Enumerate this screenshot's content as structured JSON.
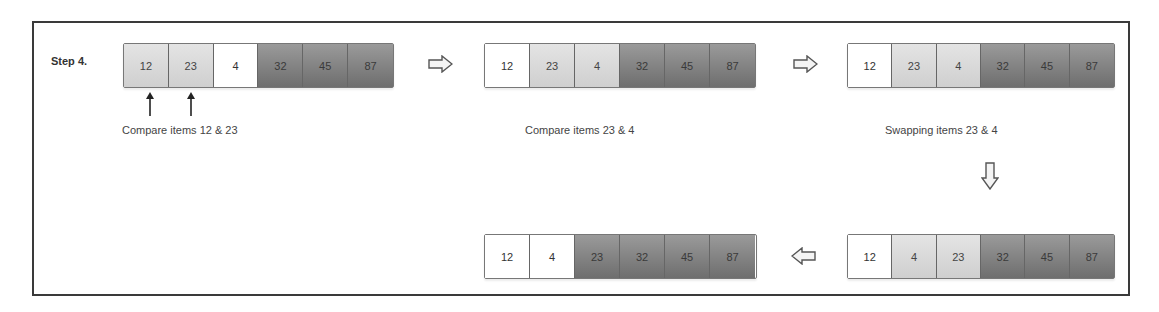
{
  "step_label": "Step 4.",
  "colors": {
    "white_cell": "#ffffff",
    "light_cell": "#d9d9d9",
    "dark_cell": "#858585",
    "frame_border": "#3a3a3a",
    "text": "#333333"
  },
  "stages": [
    {
      "id": "stage1",
      "cells": [
        {
          "value": "12",
          "shade": "light"
        },
        {
          "value": "23",
          "shade": "light"
        },
        {
          "value": "4",
          "shade": "white"
        },
        {
          "value": "32",
          "shade": "dark"
        },
        {
          "value": "45",
          "shade": "dark"
        },
        {
          "value": "87",
          "shade": "dark"
        }
      ],
      "caption": "Compare items 12 & 23"
    },
    {
      "id": "stage2",
      "cells": [
        {
          "value": "12",
          "shade": "white"
        },
        {
          "value": "23",
          "shade": "light"
        },
        {
          "value": "4",
          "shade": "light"
        },
        {
          "value": "32",
          "shade": "dark"
        },
        {
          "value": "45",
          "shade": "dark"
        },
        {
          "value": "87",
          "shade": "dark"
        }
      ],
      "caption": "Compare items 23 & 4"
    },
    {
      "id": "stage3",
      "cells": [
        {
          "value": "12",
          "shade": "white"
        },
        {
          "value": "23",
          "shade": "light"
        },
        {
          "value": "4",
          "shade": "light"
        },
        {
          "value": "32",
          "shade": "dark"
        },
        {
          "value": "45",
          "shade": "dark"
        },
        {
          "value": "87",
          "shade": "dark"
        }
      ],
      "caption": "Swapping items 23 & 4"
    },
    {
      "id": "stage4",
      "cells": [
        {
          "value": "12",
          "shade": "white"
        },
        {
          "value": "4",
          "shade": "light"
        },
        {
          "value": "23",
          "shade": "light"
        },
        {
          "value": "32",
          "shade": "dark"
        },
        {
          "value": "45",
          "shade": "dark"
        },
        {
          "value": "87",
          "shade": "dark"
        }
      ],
      "caption": ""
    },
    {
      "id": "stage5",
      "cells": [
        {
          "value": "12",
          "shade": "white"
        },
        {
          "value": "4",
          "shade": "white"
        },
        {
          "value": "23",
          "shade": "dark"
        },
        {
          "value": "32",
          "shade": "dark"
        },
        {
          "value": "45",
          "shade": "dark"
        },
        {
          "value": "87",
          "shade": "dark"
        }
      ],
      "caption": ""
    }
  ],
  "arrows": [
    {
      "direction": "right",
      "icon": "arrow-right-icon"
    },
    {
      "direction": "right",
      "icon": "arrow-right-icon"
    },
    {
      "direction": "down",
      "icon": "arrow-down-icon"
    },
    {
      "direction": "left",
      "icon": "arrow-left-icon"
    }
  ],
  "pointers": [
    {
      "target": "12",
      "icon": "pointer-up-arrow-icon"
    },
    {
      "target": "23",
      "icon": "pointer-up-arrow-icon"
    }
  ]
}
